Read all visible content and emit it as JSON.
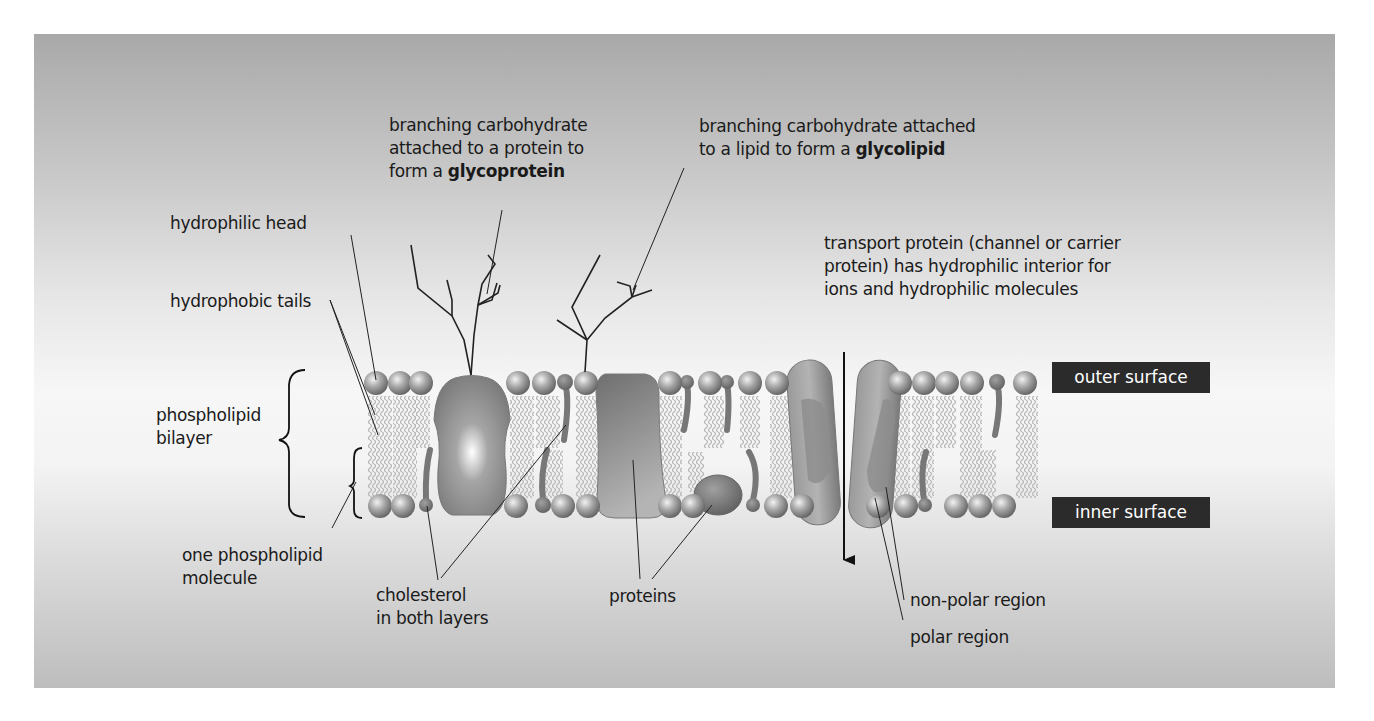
{
  "figure": {
    "colors": {
      "background_top": "#a9a9a9",
      "background_mid": "#f7f7f7",
      "background_bottom": "#bdbdbd",
      "label_text": "#1a1a1a",
      "surface_tag_bg": "#2b2b2b",
      "surface_tag_text": "#ffffff",
      "phospholipid_head": "#9a9a9a",
      "tail": "#b8b8b8",
      "cholesterol": "#777777",
      "protein": "#8a8a8a"
    }
  },
  "labels": {
    "glycoprotein": {
      "line1": "branching carbohydrate",
      "line2": "attached to a protein to",
      "line3_prefix": "form a ",
      "line3_bold": "glycoprotein"
    },
    "glycolipid": {
      "line1": "branching carbohydrate attached",
      "line2_prefix": "to a lipid to form a ",
      "line2_bold": "glycolipid"
    },
    "hydrophilic_head": "hydrophilic head",
    "hydrophobic_tails": "hydrophobic tails",
    "phospholipid_bilayer": {
      "line1": "phospholipid",
      "line2": "bilayer"
    },
    "one_phospholipid": {
      "line1": "one phospholipid",
      "line2": "molecule"
    },
    "cholesterol": {
      "line1": "cholesterol",
      "line2": "in both layers"
    },
    "proteins": "proteins",
    "transport_protein": {
      "line1": "transport protein (channel or carrier",
      "line2": "protein) has hydrophilic interior for",
      "line3": "ions and hydrophilic molecules"
    },
    "non_polar_region": "non-polar region",
    "polar_region": "polar region"
  },
  "surfaces": {
    "outer": "outer surface",
    "inner": "inner surface"
  }
}
